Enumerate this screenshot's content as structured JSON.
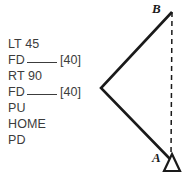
{
  "commands": {
    "lines": [
      {
        "text": "LT 45",
        "blank": false,
        "default": ""
      },
      {
        "text": "FD",
        "blank": true,
        "default": "[40]"
      },
      {
        "text": "RT 90",
        "blank": false,
        "default": ""
      },
      {
        "text": "FD",
        "blank": true,
        "default": "[40]"
      },
      {
        "text": "PU",
        "blank": false,
        "default": ""
      },
      {
        "text": "HOME",
        "blank": false,
        "default": ""
      },
      {
        "text": "PD",
        "blank": false,
        "default": ""
      }
    ]
  },
  "diagram": {
    "labels": {
      "point_a": "A",
      "point_b": "B"
    },
    "colors": {
      "stroke": "#1a1a1a",
      "text": "#3c3c3c",
      "background": "#ffffff"
    },
    "geometry": {
      "point_a": [
        170,
        160
      ],
      "point_b": [
        172,
        12
      ],
      "vertex": [
        101,
        88
      ],
      "dashed_line": "B-to-A"
    },
    "turtle": {
      "shape": "triangle-outline",
      "position": [
        172,
        163
      ],
      "heading": "up"
    }
  }
}
